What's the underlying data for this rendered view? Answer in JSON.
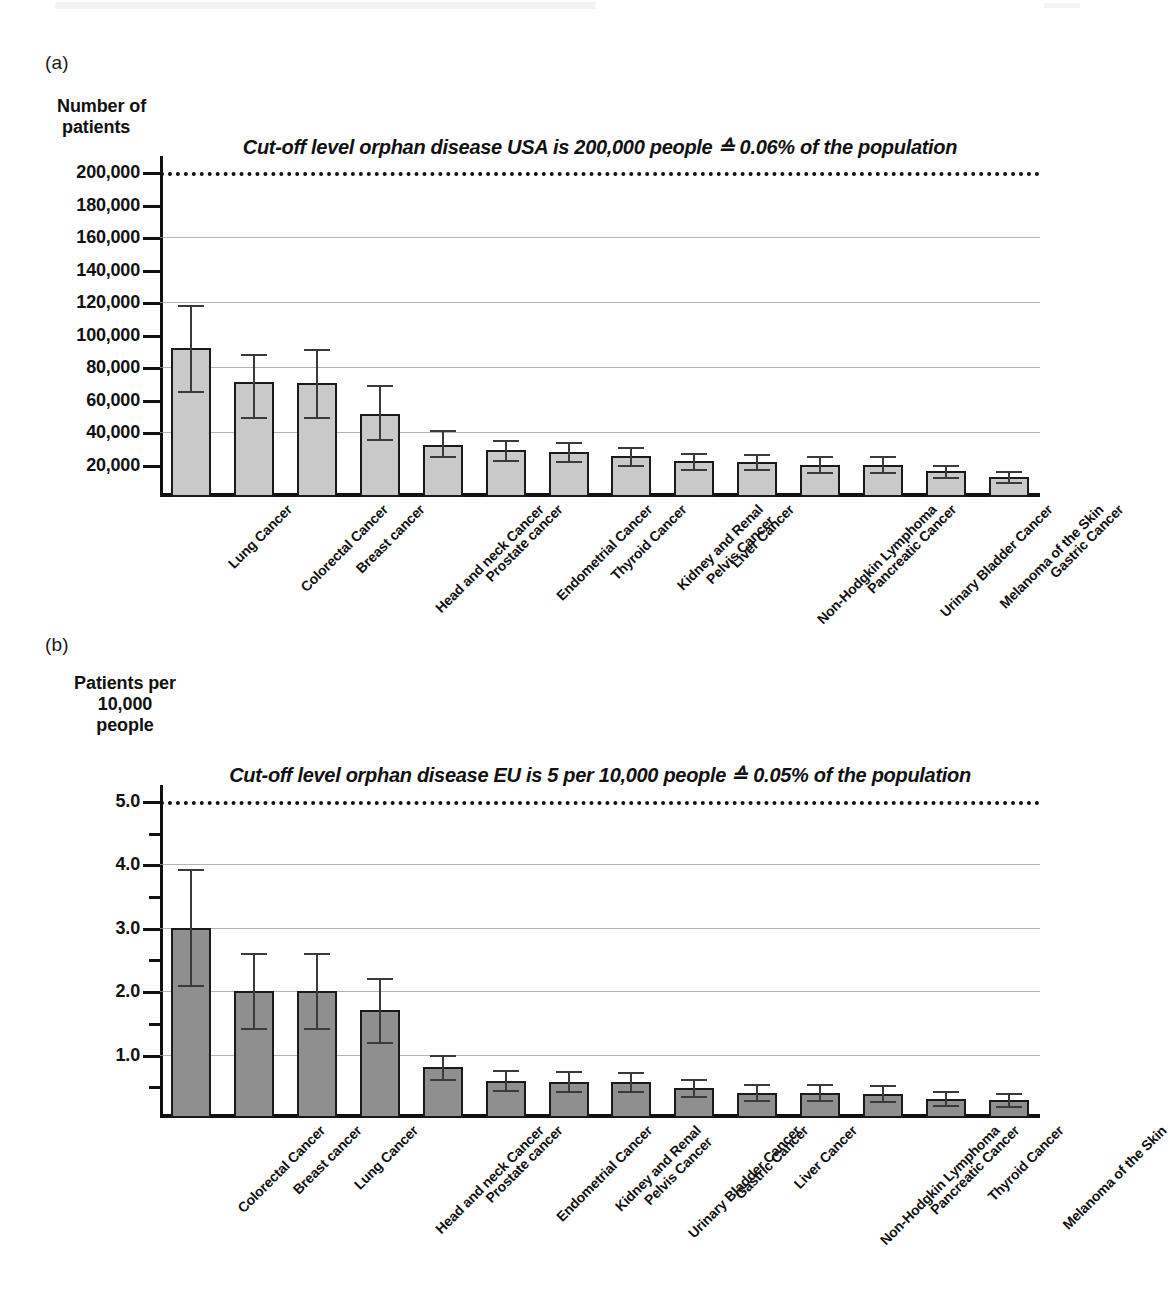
{
  "figure": {
    "panel_a_letter": "(a)",
    "panel_b_letter": "(b)"
  },
  "chart_data": [
    {
      "type": "bar",
      "panel": "(a)",
      "title": "Cut-off level orphan disease USA is 200,000 people ≙ 0.06% of the population",
      "ylabel": "Number of\npatients",
      "ylabel_line1": "Number of",
      "ylabel_line2": "patients",
      "xlabel": "",
      "ylim": [
        0,
        210000
      ],
      "grid": true,
      "legend": "none",
      "cutoff_value": 200000,
      "cutoff_label": "Cut-off level orphan disease USA is 200,000 people ≙ 0.06% of the population",
      "ytick_labels": [
        "200,000",
        "180,000",
        "160,000",
        "140,000",
        "120,000",
        "100,000",
        "80,000",
        "60,000",
        "40,000",
        "20,000"
      ],
      "yticks": [
        200000,
        180000,
        160000,
        140000,
        120000,
        100000,
        80000,
        60000,
        40000,
        20000
      ],
      "gridline_values": [
        200000,
        160000,
        120000,
        80000,
        40000
      ],
      "categories": [
        "Lung Cancer",
        "Colorectal Cancer",
        "Breast cancer",
        "Head and neck Cancer",
        "Prostate cancer",
        "Endometrial Cancer",
        "Thyroid Cancer",
        "Kidney and Renal\nPelvis Cancer",
        "Liver Cancer",
        "Non-Hodgkin Lymphoma",
        "Pancreatic Cancer",
        "Urinary Bladder Cancer",
        "Melanoma of the Skin",
        "Gastric Cancer"
      ],
      "values": [
        92000,
        71000,
        70000,
        51000,
        32000,
        29000,
        27500,
        25000,
        22000,
        21500,
        20000,
        20000,
        16000,
        12500
      ],
      "err_upper": [
        118000,
        88000,
        91000,
        69000,
        41000,
        35000,
        34000,
        31000,
        27000,
        26500,
        25500,
        25500,
        20000,
        16000
      ],
      "err_lower": [
        65000,
        49000,
        49000,
        36000,
        25000,
        23000,
        22000,
        20000,
        17500,
        17000,
        15500,
        15500,
        12500,
        9500
      ]
    },
    {
      "type": "bar",
      "panel": "(b)",
      "title": "Cut-off level orphan disease EU is 5 per 10,000 people ≙ 0.05% of the population",
      "ylabel": "Patients per\n10,000\npeople",
      "ylabel_line1": "Patients per",
      "ylabel_line2": "10,000",
      "ylabel_line3": "people",
      "xlabel": "",
      "ylim": [
        0,
        5.25
      ],
      "grid": true,
      "legend": "none",
      "cutoff_value": 5.0,
      "cutoff_label": "Cut-off level orphan disease EU is 5 per 10,000 people ≙ 0.05% of the population",
      "ytick_labels": [
        "5.0",
        "4.0",
        "3.0",
        "2.0",
        "1.0"
      ],
      "yticks": [
        5.0,
        4.0,
        3.0,
        2.0,
        1.0
      ],
      "yminor_ticks": [
        4.5,
        3.5,
        2.5,
        1.5,
        0.5
      ],
      "gridline_values": [
        5.0,
        4.0,
        3.0,
        2.0,
        1.0
      ],
      "categories": [
        "Colorectal Cancer",
        "Breast cancer",
        "Lung Cancer",
        "Head and neck Cancer",
        "Prostate cancer",
        "Endometrial Cancer",
        "Kidney and Renal\nPelvis Cancer",
        "Urinary Bladder Cancer",
        "Gastric Cancer",
        "Liver Cancer",
        "Non-Hodgkin Lymphoma",
        "Pancreatic Cancer",
        "Thyroid Cancer",
        "Melanoma of the Skin"
      ],
      "values": [
        3.0,
        2.0,
        2.0,
        1.7,
        0.8,
        0.58,
        0.57,
        0.56,
        0.47,
        0.4,
        0.39,
        0.38,
        0.3,
        0.29
      ],
      "err_upper": [
        3.92,
        2.6,
        2.6,
        2.2,
        1.0,
        0.75,
        0.74,
        0.72,
        0.62,
        0.54,
        0.53,
        0.52,
        0.42,
        0.4
      ],
      "err_lower": [
        2.1,
        1.42,
        1.42,
        1.2,
        0.62,
        0.44,
        0.43,
        0.42,
        0.35,
        0.29,
        0.28,
        0.27,
        0.2,
        0.19
      ]
    }
  ],
  "style": {
    "bar_fill_a": "#c9c9c9",
    "bar_fill_b": "#8f8f8f",
    "bar_stroke": "#1a1a1a",
    "axis_color": "#111111",
    "grid_color": "#9a9a9a",
    "error_color": "#3a3a3a"
  }
}
